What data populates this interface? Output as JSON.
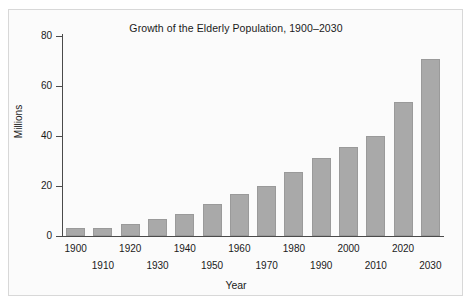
{
  "chart_data": {
    "type": "bar",
    "title": "Growth of the Elderly Population, 1900–2030",
    "xlabel": "Year",
    "ylabel": "Millions",
    "categories": [
      "1900",
      "1910",
      "1920",
      "1930",
      "1940",
      "1950",
      "1960",
      "1970",
      "1980",
      "1990",
      "2000",
      "2010",
      "2020",
      "2030"
    ],
    "values": [
      3.1,
      3.1,
      4.9,
      6.7,
      9.0,
      12.7,
      16.7,
      20.1,
      25.7,
      31.2,
      35.6,
      40.2,
      53.7,
      70.8
    ],
    "ylim": [
      0,
      80
    ],
    "yticks": [
      0,
      20,
      40,
      60,
      80
    ],
    "ytick_labels": [
      "0",
      "20",
      "40",
      "60",
      "80"
    ],
    "xtick_labels_top_row": [
      "1900",
      "1920",
      "1940",
      "1960",
      "1980",
      "2000",
      "2020"
    ],
    "xtick_labels_bottom_row": [
      "1910",
      "1930",
      "1950",
      "1970",
      "1990",
      "2010",
      "2030"
    ],
    "grid": false,
    "legend": null,
    "bar_color": "#a9a9a9",
    "axis_color": "#4a4a4a",
    "background_color": "#fbfbfb",
    "text_color": "#1a1a1a"
  }
}
